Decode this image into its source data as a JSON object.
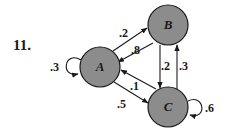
{
  "problem": {
    "number": "11."
  },
  "nodes": [
    {
      "id": "A",
      "label": "A",
      "cx": 100,
      "cy": 67,
      "r": 20
    },
    {
      "id": "B",
      "label": "B",
      "cx": 168,
      "cy": 25,
      "r": 20
    },
    {
      "id": "C",
      "label": "C",
      "cx": 168,
      "cy": 107,
      "r": 20
    }
  ],
  "edges": [
    {
      "from": "A",
      "to": "A",
      "label": ".3"
    },
    {
      "from": "A",
      "to": "B",
      "label": ".2"
    },
    {
      "from": "B",
      "to": "A",
      "label": ".8"
    },
    {
      "from": "B",
      "to": "C",
      "label": ".2"
    },
    {
      "from": "C",
      "to": "B",
      "label": ".3"
    },
    {
      "from": "C",
      "to": "A",
      "label": ".1"
    },
    {
      "from": "A",
      "to": "C",
      "label": ".5"
    },
    {
      "from": "C",
      "to": "C",
      "label": ".6"
    }
  ],
  "colors": {
    "node_fill": "#8c8c8c",
    "stroke": "#1a1a1a",
    "background": "#ffffff"
  }
}
